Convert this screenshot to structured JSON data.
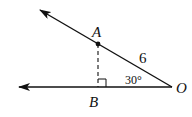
{
  "diagram": {
    "type": "geometry",
    "points": {
      "O": {
        "label": "O",
        "x": 172,
        "y": 87
      },
      "A": {
        "label": "A",
        "x": 98,
        "y": 44
      },
      "B": {
        "label": "B",
        "x": 98,
        "y": 87
      }
    },
    "rays": [
      {
        "name": "ray-OA",
        "from": "O",
        "through": "A",
        "arrow_tip": {
          "x": 38,
          "y": 9
        }
      },
      {
        "name": "ray-OB",
        "from": "O",
        "through": "B",
        "arrow_tip": {
          "x": 17,
          "y": 87
        }
      }
    ],
    "segments": [
      {
        "name": "AB",
        "style": "dashed",
        "from": "A",
        "to": "B"
      }
    ],
    "annotations": {
      "length_OA": "6",
      "angle_O": "30°",
      "right_angle_at": "B"
    },
    "colors": {
      "stroke": "#111111",
      "background": "#ffffff"
    }
  }
}
